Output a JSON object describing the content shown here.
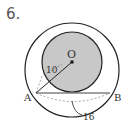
{
  "problem": {
    "number": "6."
  },
  "diagram": {
    "center_label": "O",
    "point_a": "A",
    "point_b": "B",
    "radius_label": "10",
    "chord_label": "16",
    "colors": {
      "shade": "#c8c8c8",
      "stroke": "#222222"
    }
  }
}
